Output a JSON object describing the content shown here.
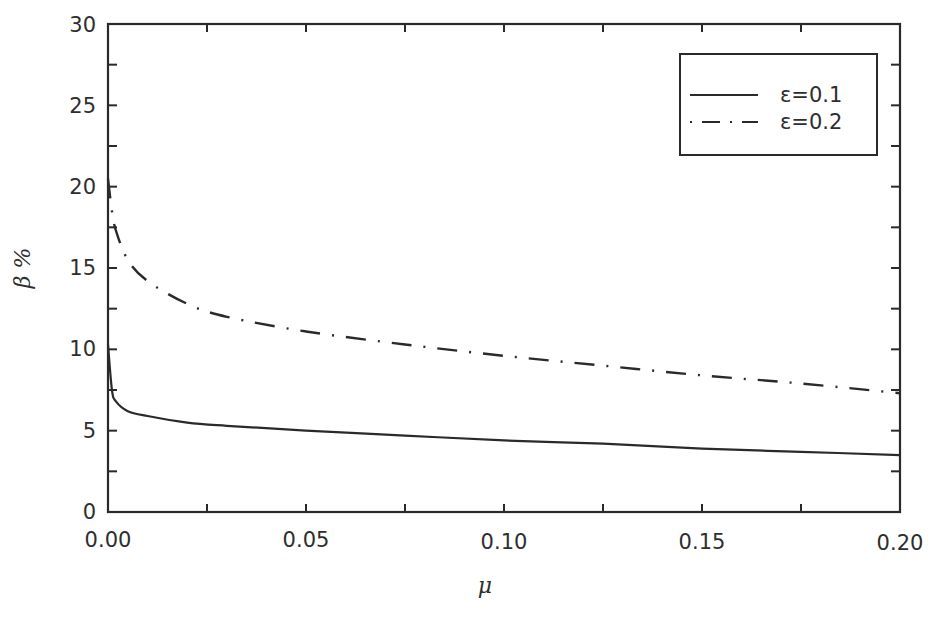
{
  "chart_data": {
    "type": "line",
    "title": "",
    "xlabel": "μ",
    "ylabel": "β %",
    "xlim": [
      0.0,
      0.2
    ],
    "ylim": [
      0,
      30
    ],
    "xticks": [
      "0.00",
      "0.05",
      "0.10",
      "0.15",
      "0.20"
    ],
    "yticks": [
      "0",
      "5",
      "10",
      "15",
      "20",
      "25",
      "30"
    ],
    "grid": false,
    "legend_position": "upper right",
    "series": [
      {
        "name": "ε=0.1",
        "style": "solid",
        "x": [
          0.0,
          0.001,
          0.002,
          0.005,
          0.01,
          0.02,
          0.03,
          0.05,
          0.075,
          0.1,
          0.125,
          0.15,
          0.175,
          0.2
        ],
        "y": [
          10.3,
          7.5,
          6.8,
          6.2,
          5.9,
          5.5,
          5.3,
          5.0,
          4.7,
          4.4,
          4.2,
          3.9,
          3.7,
          3.5
        ]
      },
      {
        "name": "ε=0.2",
        "style": "dash-dot",
        "x": [
          0.0,
          0.001,
          0.002,
          0.005,
          0.01,
          0.02,
          0.03,
          0.05,
          0.075,
          0.1,
          0.125,
          0.15,
          0.175,
          0.2
        ],
        "y": [
          20.5,
          18.5,
          17.3,
          15.5,
          14.2,
          12.8,
          12.0,
          11.1,
          10.3,
          9.6,
          9.0,
          8.4,
          7.9,
          7.3
        ]
      }
    ]
  },
  "legend": {
    "items": [
      {
        "label": "ε=0.1",
        "style": "solid"
      },
      {
        "label": "ε=0.2",
        "style": "dash-dot"
      }
    ]
  },
  "axes": {
    "x_label": "μ",
    "y_label": "β %",
    "x_ticks": [
      "0.00",
      "0.05",
      "0.10",
      "0.15",
      "0.20"
    ],
    "y_ticks": [
      "0",
      "5",
      "10",
      "15",
      "20",
      "25",
      "30"
    ]
  }
}
